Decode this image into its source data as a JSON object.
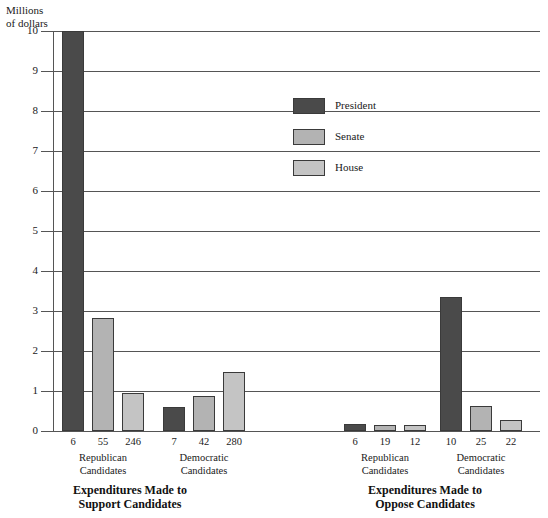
{
  "chart_data": {
    "type": "bar",
    "title": "",
    "ylabel": "Millions\nof dollars",
    "xlabel": "",
    "ylim": [
      0,
      10
    ],
    "yticks": [
      0,
      1,
      2,
      3,
      4,
      5,
      6,
      7,
      8,
      9,
      10
    ],
    "ytick_labels": [
      "0",
      "1",
      "2",
      "3",
      "4",
      "5",
      "6",
      "7",
      "8",
      "9",
      "10"
    ],
    "grid": true,
    "legend_position": "upper center",
    "legend": [
      "President",
      "Senate",
      "House"
    ],
    "series": [
      {
        "name": "President",
        "color": "#4a4a4a",
        "values": [
          10.0,
          0.6,
          0.17,
          3.35
        ]
      },
      {
        "name": "Senate",
        "color": "#b3b3b3",
        "values": [
          2.82,
          0.88,
          0.14,
          0.62
        ]
      },
      {
        "name": "House",
        "color": "#c4c4c4",
        "values": [
          0.95,
          1.47,
          0.16,
          0.28
        ]
      }
    ],
    "groups": [
      {
        "section": "Expenditures Made to\nSupport Candidates",
        "label": "Republican\nCandidates",
        "counts": [
          "6",
          "55",
          "246"
        ],
        "values": [
          10.0,
          2.82,
          0.95
        ]
      },
      {
        "section": "Expenditures Made to\nSupport Candidates",
        "label": "Democratic\nCandidates",
        "counts": [
          "7",
          "42",
          "280"
        ],
        "values": [
          0.6,
          0.88,
          1.47
        ]
      },
      {
        "section": "Expenditures Made to\nOppose Candidates",
        "label": "Republican\nCandidates",
        "counts": [
          "6",
          "19",
          "12"
        ],
        "values": [
          0.17,
          0.14,
          0.16
        ]
      },
      {
        "section": "Expenditures Made to\nOppose Candidates",
        "label": "Democratic\nCandidates",
        "counts": [
          "10",
          "25",
          "22"
        ],
        "values": [
          3.35,
          0.62,
          0.28
        ]
      }
    ],
    "sections": [
      "Expenditures Made to\nSupport Candidates",
      "Expenditures Made to\nOppose Candidates"
    ]
  }
}
